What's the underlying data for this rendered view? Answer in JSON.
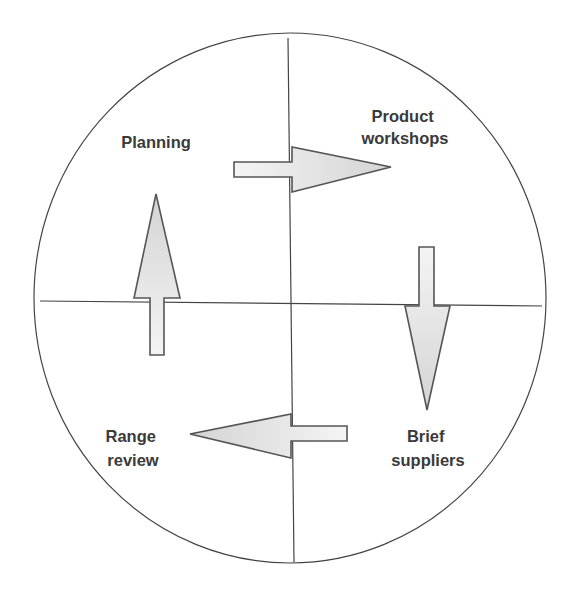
{
  "diagram": {
    "type": "cycle",
    "quadrants": [
      {
        "position": "top-left",
        "lines": [
          "Planning"
        ]
      },
      {
        "position": "top-right",
        "lines": [
          "Product",
          "workshops"
        ]
      },
      {
        "position": "bottom-right",
        "lines": [
          "Brief",
          "suppliers"
        ]
      },
      {
        "position": "bottom-left",
        "lines": [
          "Range",
          "review"
        ]
      }
    ],
    "flow": [
      {
        "from": "Planning",
        "to": "Product workshops",
        "direction": "right"
      },
      {
        "from": "Product workshops",
        "to": "Brief suppliers",
        "direction": "down"
      },
      {
        "from": "Brief suppliers",
        "to": "Range review",
        "direction": "left"
      },
      {
        "from": "Range review",
        "to": "Planning",
        "direction": "up"
      }
    ],
    "colors": {
      "outline": "#444444",
      "arrow_stroke": "#555555",
      "arrow_fill_light": "#f2f2f2",
      "arrow_fill_dark": "#d6d6d6",
      "text": "#3a3a3a"
    }
  }
}
